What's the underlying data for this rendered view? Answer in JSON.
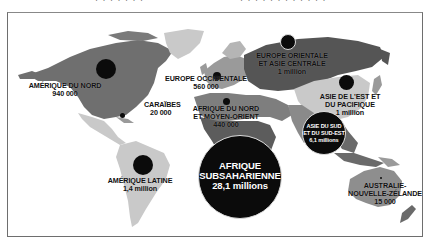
{
  "top_fragment": {
    "text_left": "· · · · · · ·",
    "text_right": "· · · · · · · · · · · ·"
  },
  "map": {
    "colors": {
      "background": "#ffffff",
      "land_light": "#c9c9c9",
      "land_mid": "#9a9a9a",
      "land_dark": "#6f6f6f",
      "land_darker": "#555555",
      "bubble": "#0b0b0b",
      "frame": "#6e6e6e"
    },
    "regions": [
      {
        "id": "north-america",
        "name": "AMÉRIQUE DU NORD",
        "value": "940 000"
      },
      {
        "id": "caribbean",
        "name": "CARAÏBES",
        "value": "20 000"
      },
      {
        "id": "latin-america",
        "name": "AMÉRIQUE LATINE",
        "value": "1,4 million"
      },
      {
        "id": "western-europe",
        "name": "EUROPE OCCIDENTALE",
        "value": "560 000"
      },
      {
        "id": "north-africa-middle-east",
        "name_line1": "AFRIQUE DU NORD",
        "name_line2": "ET MOYEN-ORIENT",
        "value": "440 000"
      },
      {
        "id": "eastern-europe-central-asia",
        "name_line1": "EUROPE ORIENTALE",
        "name_line2": "ET ASIE CENTRALE",
        "value": "1 million"
      },
      {
        "id": "east-asia-pacific",
        "name_line1": "ASIE DE L'EST ET",
        "name_line2": "DU PACIFIQUE",
        "value": "1 million"
      },
      {
        "id": "south-southeast-asia",
        "name_line1": "ASIE DU SUD",
        "name_line2": "ET DU SUD-EST",
        "value": "6,1 millions"
      },
      {
        "id": "sub-saharan-africa",
        "name_line1": "AFRIQUE",
        "name_line2": "SUBSAHARIENNE",
        "value": "28,1 millions"
      },
      {
        "id": "australia-nz",
        "name_line1": "AUSTRALIE-",
        "name_line2": "NOUVELLE-ZÉLANDE",
        "value": "15 000"
      }
    ]
  }
}
